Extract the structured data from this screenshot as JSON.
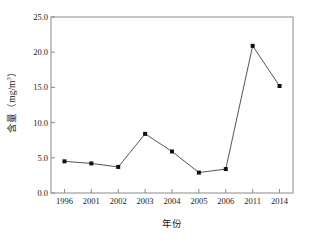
{
  "chart_data": {
    "type": "line",
    "title": "",
    "subtitle": "",
    "xlabel": "年份",
    "ylabel": "含量（mg/m",
    "ylabel_sup": "3",
    "ylabel_tail": "）",
    "ylabel_full": "含量（mg/m3）",
    "categories": [
      "1996",
      "2001",
      "2002",
      "2003",
      "2004",
      "2005",
      "2006",
      "2011",
      "2014"
    ],
    "values": [
      4.5,
      4.2,
      3.7,
      8.4,
      5.9,
      2.9,
      3.4,
      20.9,
      15.2
    ],
    "series": [
      {
        "name": "含量",
        "values": [
          4.5,
          4.2,
          3.7,
          8.4,
          5.9,
          2.9,
          3.4,
          20.9,
          15.2
        ]
      }
    ],
    "ylim": [
      0.0,
      25.0
    ],
    "ytick_values": [
      0.0,
      5.0,
      10.0,
      15.0,
      20.0,
      25.0
    ],
    "ytick_labels": [
      "0.0",
      "5.0",
      "10.0",
      "15.0",
      "20.0",
      "25.0"
    ],
    "xtick_labels": [
      "1996",
      "2001",
      "2002",
      "2003",
      "2004",
      "2005",
      "2006",
      "2011",
      "2014"
    ],
    "grid": false,
    "legend": "none",
    "marker": "filled-square",
    "line_color": "#555555",
    "marker_color": "#111111",
    "axis_color": "#8a8a8a",
    "text_color": "#1a1a1a"
  }
}
